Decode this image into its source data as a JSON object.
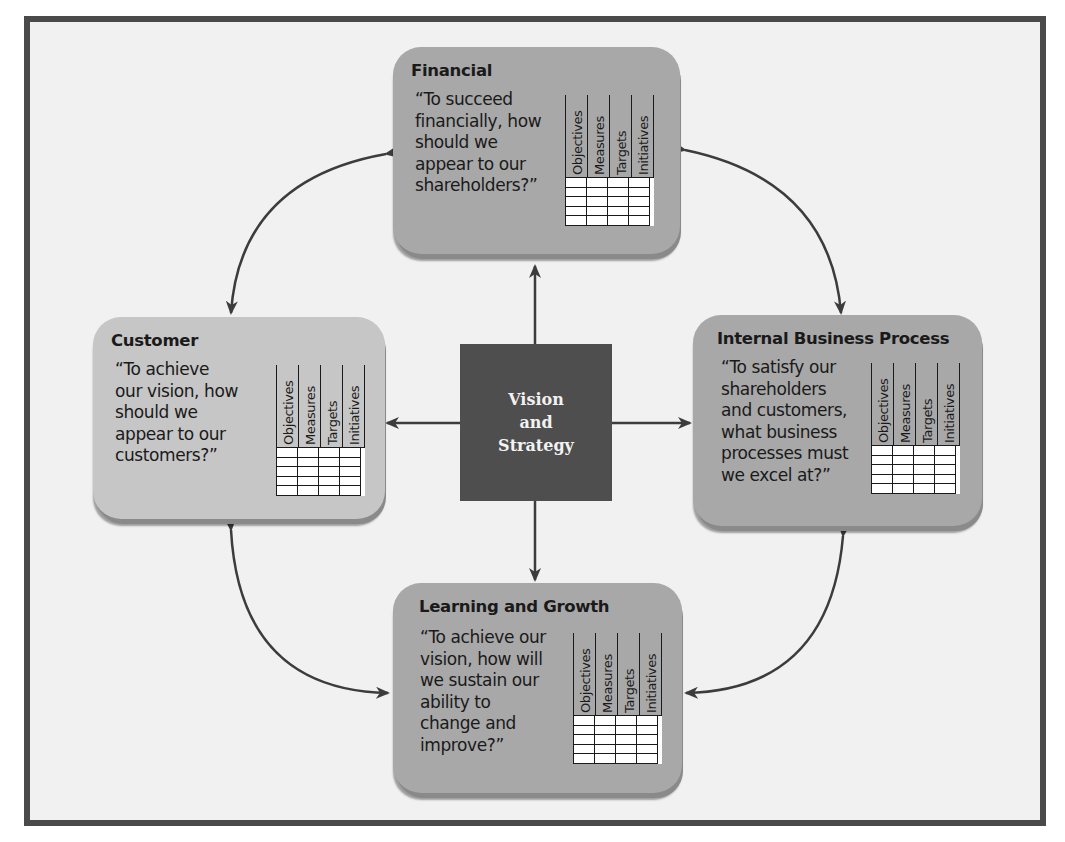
{
  "diagram": {
    "type": "balanced-scorecard",
    "center": {
      "label": "Vision\nand\nStrategy"
    },
    "perspectives": [
      {
        "id": "financial",
        "title": "Financial",
        "question": "“To succeed\nfinancially, how\nshould we\nappear to our\nshareholders?”",
        "columns": [
          "Objectives",
          "Measures",
          "Targets",
          "Initiatives"
        ],
        "rows": 5
      },
      {
        "id": "customer",
        "title": "Customer",
        "question": "“To achieve\nour vision, how\nshould we\nappear to our\ncustomers?”",
        "columns": [
          "Objectives",
          "Measures",
          "Targets",
          "Initiatives"
        ],
        "rows": 5
      },
      {
        "id": "internal-business-process",
        "title": "Internal Business Process",
        "question": "“To satisfy our\nshareholders\nand customers,\nwhat business\nprocesses must\nwe excel at?”",
        "columns": [
          "Objectives",
          "Measures",
          "Targets",
          "Initiatives"
        ],
        "rows": 5
      },
      {
        "id": "learning-and-growth",
        "title": "Learning and Growth",
        "question": "“To achieve our\nvision, how will\nwe sustain our\nability to\nchange and\nimprove?”",
        "columns": [
          "Objectives",
          "Measures",
          "Targets",
          "Initiatives"
        ],
        "rows": 5
      }
    ],
    "connections": [
      {
        "from": "center",
        "to": "financial",
        "kind": "arrow"
      },
      {
        "from": "center",
        "to": "customer",
        "kind": "arrow"
      },
      {
        "from": "center",
        "to": "internal-business-process",
        "kind": "arrow"
      },
      {
        "from": "center",
        "to": "learning-and-growth",
        "kind": "arrow"
      },
      {
        "from": "financial",
        "to": "customer",
        "kind": "double-arrow-curved"
      },
      {
        "from": "financial",
        "to": "internal-business-process",
        "kind": "double-arrow-curved"
      },
      {
        "from": "customer",
        "to": "learning-and-growth",
        "kind": "double-arrow-curved"
      },
      {
        "from": "internal-business-process",
        "to": "learning-and-growth",
        "kind": "double-arrow-curved"
      }
    ],
    "colors": {
      "frame": "#4a4a4a",
      "background": "#f1f1f1",
      "box_medium": "#a8a8a8",
      "box_light": "#c6c6c6",
      "center_box": "#4e4e4e",
      "arrow": "#3c3c3c"
    }
  }
}
